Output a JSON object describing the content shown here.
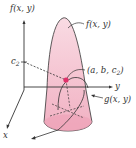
{
  "diagram": {
    "labels": {
      "vertical_axis": "f(x, y)",
      "c_level": "c",
      "c_level_sub": "2",
      "surface_f": "f(x, y)",
      "point_prefix": "(a, b, c",
      "point_sub": "2",
      "point_suffix": ")",
      "y_axis": "y",
      "x_axis": "x",
      "constraint_g": "g(x, y)"
    },
    "colors": {
      "surface_fill": "#f5c6d3",
      "surface_fill_dark": "#eea3b8",
      "point": "#e0306a",
      "axis": "#333333"
    }
  }
}
